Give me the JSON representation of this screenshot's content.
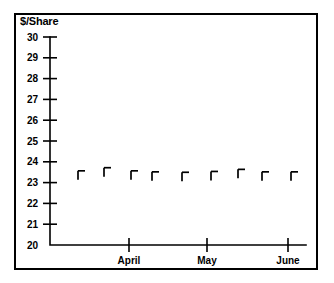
{
  "chart_data": {
    "type": "scatter",
    "title": "",
    "subtitle": "",
    "ylabel": "$/Share",
    "xlabel": "",
    "ylim": [
      20,
      30
    ],
    "yticks": [
      30,
      29,
      28,
      27,
      26,
      25,
      24,
      23,
      22,
      21,
      20
    ],
    "ytick_labels": [
      "30",
      "29",
      "28",
      "27",
      "26",
      "25",
      "24",
      "23",
      "22",
      "21",
      "20"
    ],
    "xticks": [
      "April",
      "May",
      "June"
    ],
    "xtick_labels": [
      "April",
      "May",
      "June"
    ],
    "grid": false,
    "legend": null,
    "marker_style": "right-tee",
    "series": [
      {
        "name": "share-price",
        "values": [
          23.35,
          23.5,
          23.35,
          23.3,
          23.28,
          23.32,
          23.42,
          23.3,
          23.3
        ]
      }
    ],
    "points": [
      {
        "x_px": 78,
        "value": 23.35
      },
      {
        "x_px": 104,
        "value": 23.5
      },
      {
        "x_px": 131,
        "value": 23.35
      },
      {
        "x_px": 152,
        "value": 23.3
      },
      {
        "x_px": 182,
        "value": 23.28
      },
      {
        "x_px": 211,
        "value": 23.32
      },
      {
        "x_px": 238,
        "value": 23.42
      },
      {
        "x_px": 262,
        "value": 23.3
      },
      {
        "x_px": 291,
        "value": 23.3
      }
    ],
    "axis_geometry": {
      "x_axis_left_px": 50,
      "x_axis_right_px": 306,
      "y_axis_top_px": 37,
      "y_axis_bottom_px": 245,
      "xtick_px": [
        129,
        207,
        288
      ]
    },
    "colors": {
      "axis": "#000000",
      "marker": "#000000",
      "background": "#ffffff",
      "frame": "#000000"
    }
  }
}
